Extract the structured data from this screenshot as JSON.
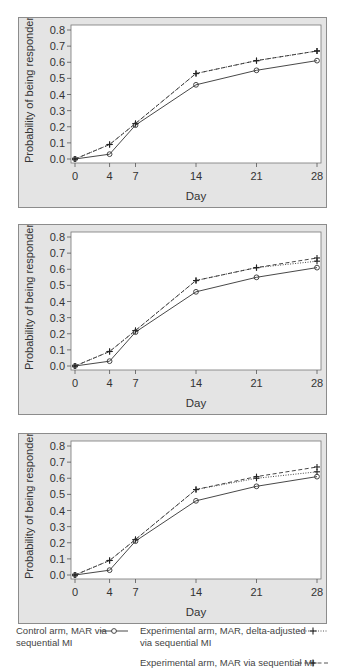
{
  "chart_data": [
    {
      "type": "line",
      "panel": 1,
      "title": "",
      "xlabel": "Day",
      "ylabel": "Probability of being responder",
      "x": [
        0,
        4,
        7,
        14,
        21,
        28
      ],
      "xticks": [
        "0",
        "4",
        "7",
        "14",
        "21",
        "28"
      ],
      "yticks": [
        "0.0",
        "0.1",
        "0.2",
        "0.3",
        "0.4",
        "0.5",
        "0.6",
        "0.7",
        "0.8"
      ],
      "ylim": [
        0,
        0.8
      ],
      "grid": false,
      "series": [
        {
          "name": "Control arm, MAR via sequential MI",
          "style": "solid",
          "marker": "circle",
          "values": [
            0.0,
            0.03,
            0.21,
            0.46,
            0.55,
            0.61
          ]
        },
        {
          "name": "Experimental arm, MAR via sequential MI",
          "style": "dashed",
          "marker": "plus",
          "values": [
            0.0,
            0.09,
            0.22,
            0.53,
            0.61,
            0.67
          ]
        },
        {
          "name": "Experimental arm, MAR, delta-adjusted via sequential MI",
          "style": "dotted",
          "marker": "plus",
          "values": [
            0.0,
            0.09,
            0.22,
            0.53,
            0.61,
            0.67
          ]
        }
      ]
    },
    {
      "type": "line",
      "panel": 2,
      "title": "",
      "xlabel": "Day",
      "ylabel": "Probability of being responder",
      "x": [
        0,
        4,
        7,
        14,
        21,
        28
      ],
      "xticks": [
        "0",
        "4",
        "7",
        "14",
        "21",
        "28"
      ],
      "yticks": [
        "0.0",
        "0.1",
        "0.2",
        "0.3",
        "0.4",
        "0.5",
        "0.6",
        "0.7",
        "0.8"
      ],
      "ylim": [
        0,
        0.8
      ],
      "grid": false,
      "series": [
        {
          "name": "Control arm, MAR via sequential MI",
          "style": "solid",
          "marker": "circle",
          "values": [
            0.0,
            0.03,
            0.21,
            0.46,
            0.55,
            0.61
          ]
        },
        {
          "name": "Experimental arm, MAR via sequential MI",
          "style": "dashed",
          "marker": "plus",
          "values": [
            0.0,
            0.09,
            0.22,
            0.53,
            0.61,
            0.67
          ]
        },
        {
          "name": "Experimental arm, MAR, delta-adjusted via sequential MI",
          "style": "dotted",
          "marker": "plus",
          "values": [
            0.0,
            0.09,
            0.22,
            0.53,
            0.61,
            0.65
          ]
        }
      ]
    },
    {
      "type": "line",
      "panel": 3,
      "title": "",
      "xlabel": "Day",
      "ylabel": "Probability of being responder",
      "x": [
        0,
        4,
        7,
        14,
        21,
        28
      ],
      "xticks": [
        "0",
        "4",
        "7",
        "14",
        "21",
        "28"
      ],
      "yticks": [
        "0.0",
        "0.1",
        "0.2",
        "0.3",
        "0.4",
        "0.5",
        "0.6",
        "0.7",
        "0.8"
      ],
      "ylim": [
        0,
        0.8
      ],
      "grid": false,
      "series": [
        {
          "name": "Control arm, MAR via sequential MI",
          "style": "solid",
          "marker": "circle",
          "values": [
            0.0,
            0.03,
            0.21,
            0.46,
            0.55,
            0.61
          ]
        },
        {
          "name": "Experimental arm, MAR via sequential MI",
          "style": "dashed",
          "marker": "plus",
          "values": [
            0.0,
            0.09,
            0.22,
            0.53,
            0.61,
            0.67
          ]
        },
        {
          "name": "Experimental arm, MAR, delta-adjusted via sequential MI",
          "style": "dotted",
          "marker": "plus",
          "values": [
            0.0,
            0.09,
            0.22,
            0.53,
            0.6,
            0.64
          ]
        }
      ]
    }
  ],
  "legend": {
    "control": {
      "line1": "Control arm, MAR via",
      "line2": "sequential MI"
    },
    "delta": {
      "line1": "Experimental arm, MAR, delta-adjusted",
      "line2": "via sequential MI"
    },
    "mar": {
      "line1": "Experimental arm, MAR via sequential MI"
    }
  },
  "colors": {
    "panel_bg": "#e4e4e4",
    "panel_border": "#8c8c8c",
    "plot_bg": "#ffffff",
    "line": "#333333",
    "text": "#333333"
  }
}
